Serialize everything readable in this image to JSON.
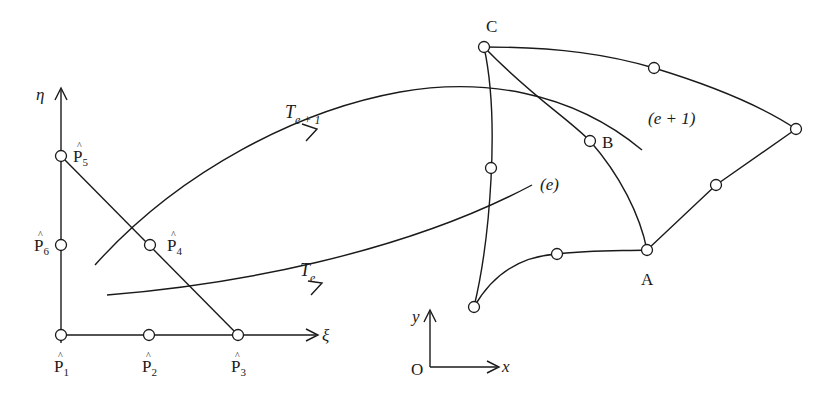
{
  "reference_element": {
    "axes": {
      "vertical_label": "η",
      "horizontal_label": "ξ"
    },
    "nodes": [
      {
        "id": "P1",
        "label_base": "P",
        "label_sub": "1"
      },
      {
        "id": "P2",
        "label_base": "P",
        "label_sub": "2"
      },
      {
        "id": "P3",
        "label_base": "P",
        "label_sub": "3"
      },
      {
        "id": "P4",
        "label_base": "P",
        "label_sub": "4"
      },
      {
        "id": "P5",
        "label_base": "P",
        "label_sub": "5"
      },
      {
        "id": "P6",
        "label_base": "P",
        "label_sub": "6"
      }
    ],
    "hat": "^"
  },
  "mappings": [
    {
      "id": "Te1",
      "label_base": "T",
      "label_sub": "e + 1",
      "target": "(e + 1)"
    },
    {
      "id": "Te",
      "label_base": "T",
      "label_sub": "e",
      "target": "(e)"
    }
  ],
  "physical_elements": {
    "vertex_labels": {
      "A": "A",
      "B": "B",
      "C": "C"
    },
    "element_labels": {
      "upper": "(e + 1)",
      "lower": "(e)"
    }
  },
  "global_axes": {
    "origin": "O",
    "x": "x",
    "y": "y"
  },
  "colors": {
    "ink": "#1a1a1a",
    "background": "#ffffff"
  }
}
